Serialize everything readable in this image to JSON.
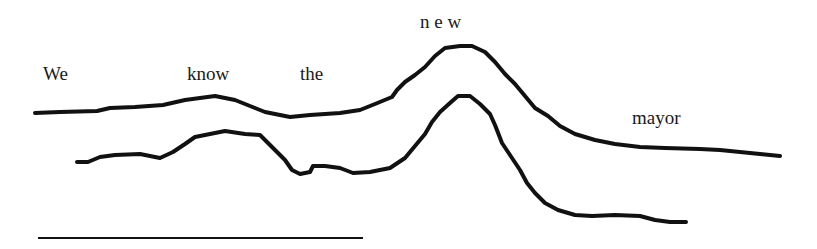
{
  "diagram": {
    "type": "intonation-contour",
    "words": [
      {
        "text": "We",
        "x": 43,
        "y": 64
      },
      {
        "text": "know",
        "x": 187,
        "y": 64
      },
      {
        "text": "the",
        "x": 300,
        "y": 64
      },
      {
        "text": "n e w",
        "x": 420,
        "y": 12
      },
      {
        "text": "mayor",
        "x": 632,
        "y": 108
      }
    ],
    "contours": [
      {
        "name": "upper-contour",
        "points": "M35,113 L60,112 L97,111 L110,108 L135,107 L163,105 L185,100 L200,98 L215,96 L235,100 L250,106 L265,112 L290,117 L310,115 L340,113 L360,110 L375,104 L392,97 L397,90 L405,82 L415,75 L425,67 L435,56 L445,48 L460,46 L472,46 L485,52 L495,62 L505,74 L515,84 L525,96 L535,108 L548,116 L560,126 L575,134 L595,140 L615,144 L640,147 L665,148 L700,149 L720,150 L740,152 L760,154 L780,156"
      },
      {
        "name": "lower-contour",
        "points": "M77,162 L88,162 L100,157 L115,155 L140,154 L160,158 L173,152 L185,144 L195,137 L210,134 L225,131 L245,134 L260,135 L275,150 L285,160 L292,170 L300,174 L310,172 L313,166 L325,166 L340,168 L353,173 L370,172 L390,168 L405,158 L415,146 L425,134 L432,122 L440,112 L450,103 L458,96 L470,96 L480,104 L490,114 L495,125 L502,143 L510,155 L520,170 L527,183 L535,193 L545,203 L558,210 L575,215 L592,216 L615,215 L640,216 L655,220 L670,222 L686,222"
      }
    ],
    "baseline": {
      "x1": 38,
      "y1": 238,
      "x2": 363,
      "y2": 238
    }
  }
}
